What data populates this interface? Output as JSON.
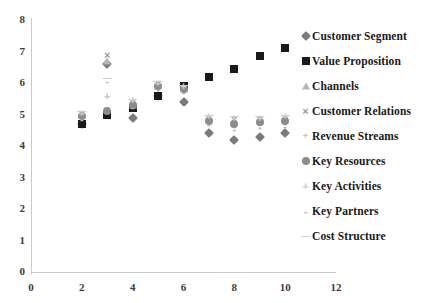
{
  "chart_data": {
    "type": "scatter",
    "title": "",
    "xlabel": "",
    "ylabel": "",
    "xlim": [
      0,
      12
    ],
    "ylim": [
      0,
      8
    ],
    "xticks": [
      0,
      2,
      4,
      6,
      8,
      10,
      12
    ],
    "yticks": [
      0,
      1,
      2,
      3,
      4,
      5,
      6,
      7,
      8
    ],
    "grid": false,
    "legend_position": "right",
    "x": [
      2,
      3,
      4,
      5,
      6,
      7,
      8,
      9,
      10
    ],
    "series": [
      {
        "name": "Customer Segment",
        "marker": "diamond",
        "color": "#7a7a7a",
        "values": [
          4.7,
          6.6,
          4.9,
          5.6,
          5.4,
          4.4,
          4.2,
          4.3,
          4.4
        ]
      },
      {
        "name": "Value Proposition",
        "marker": "square",
        "color": "#1a1a1a",
        "values": [
          4.7,
          5.0,
          5.2,
          5.6,
          5.9,
          6.2,
          6.45,
          6.85,
          7.1
        ]
      },
      {
        "name": "Channels",
        "marker": "triangle",
        "color": "#b4b4b4",
        "values": [
          5.0,
          6.7,
          5.3,
          5.9,
          5.8,
          4.85,
          4.8,
          4.8,
          4.85
        ]
      },
      {
        "name": "Customer Relations",
        "marker": "cross",
        "color": "#9b9b9b",
        "values": [
          5.05,
          6.9,
          5.4,
          6.0,
          5.85,
          4.9,
          4.85,
          4.85,
          4.9
        ]
      },
      {
        "name": "Revenue Streams",
        "marker": "plus-small",
        "color": "#c2c2c2",
        "values": [
          4.9,
          5.55,
          5.3,
          5.85,
          5.75,
          4.75,
          4.6,
          4.65,
          4.7
        ]
      },
      {
        "name": "Key Resources",
        "marker": "circle",
        "color": "#8c8c8c",
        "values": [
          4.95,
          5.1,
          5.3,
          5.9,
          5.8,
          4.8,
          4.7,
          4.75,
          4.8
        ]
      },
      {
        "name": "Key Activities",
        "marker": "plus",
        "color": "#cccccc",
        "values": [
          5.05,
          5.6,
          5.45,
          6.0,
          5.9,
          4.95,
          4.9,
          4.9,
          4.95
        ]
      },
      {
        "name": "Key Partners",
        "marker": "dash",
        "color": "#b8b8b8",
        "values": [
          4.85,
          6.05,
          5.25,
          5.8,
          5.7,
          4.7,
          4.55,
          4.6,
          4.65
        ]
      },
      {
        "name": "Cost Structure",
        "marker": "line",
        "color": "#d0d0d0",
        "values": [
          5.1,
          6.15,
          5.5,
          6.05,
          5.95,
          5.0,
          4.95,
          4.95,
          5.0
        ]
      }
    ]
  },
  "axes": {
    "x_tick_labels": [
      "0",
      "2",
      "4",
      "6",
      "8",
      "10",
      "12"
    ],
    "y_tick_labels": [
      "0",
      "1",
      "2",
      "3",
      "4",
      "5",
      "6",
      "7",
      "8"
    ]
  },
  "legend": {
    "items": [
      {
        "label": "Customer Segment",
        "glyph": "◆",
        "marker": "diamond",
        "color": "#7a7a7a"
      },
      {
        "label": "Value Proposition",
        "glyph": "■",
        "marker": "square",
        "color": "#1a1a1a"
      },
      {
        "label": "Channels",
        "glyph": "▲",
        "marker": "triangle",
        "color": "#b4b4b4"
      },
      {
        "label": "Customer Relations",
        "glyph": "×",
        "marker": "cross",
        "color": "#9b9b9b"
      },
      {
        "label": "Revenue Streams",
        "glyph": "+",
        "marker": "plus-small",
        "color": "#c2c2c2"
      },
      {
        "label": "Key Resources",
        "glyph": "●",
        "marker": "circle",
        "color": "#8c8c8c"
      },
      {
        "label": "Key Activities",
        "glyph": "+",
        "marker": "plus",
        "color": "#cccccc"
      },
      {
        "label": "Key Partners",
        "glyph": "-",
        "marker": "dash",
        "color": "#b8b8b8"
      },
      {
        "label": "Cost Structure",
        "glyph": "—",
        "marker": "line",
        "color": "#d0d0d0"
      }
    ]
  }
}
